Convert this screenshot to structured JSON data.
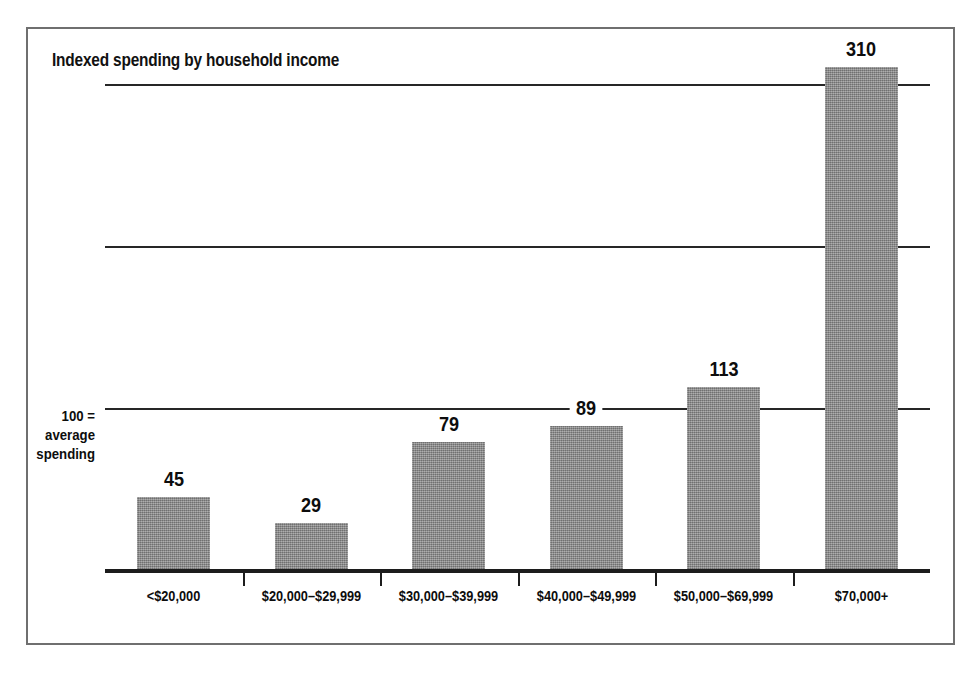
{
  "figure": {
    "border_color": "#6f6f6f",
    "background": "#ffffff"
  },
  "chart_data": {
    "type": "bar",
    "title": "Indexed spending by household income",
    "subtitle": "",
    "xlabel": "",
    "ylabel": "",
    "categories": [
      "<$20,000",
      "$20,000–$29,999",
      "$30,000–$39,999",
      "$40,000–$49,999",
      "$50,000–$69,999",
      "$70,000+"
    ],
    "values": [
      45,
      29,
      79,
      89,
      113,
      310
    ],
    "value_labels": [
      "45",
      "29",
      "79",
      "89",
      "113",
      "310"
    ],
    "ylim": [
      0,
      322
    ],
    "gridlines": [
      100,
      200,
      300
    ],
    "grid": true,
    "legend": "none",
    "bar_color": "#8d8d8d",
    "annotations": [
      {
        "name": "baseline-note",
        "lines": [
          "100 =",
          "average",
          "spending"
        ],
        "value": 100,
        "position": "left-of-axis"
      }
    ]
  },
  "annotation": {
    "line1": "100 =",
    "line2": "average",
    "line3": "spending"
  }
}
